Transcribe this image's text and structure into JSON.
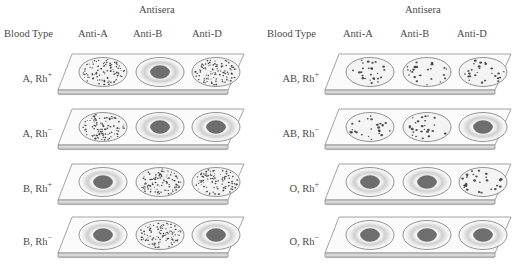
{
  "figure": {
    "title_implied": "ABO and Rh blood typing agglutination slides",
    "column_header_group": "Antisera",
    "column_headers": [
      "Blood Type",
      "Anti-A",
      "Anti-B",
      "Anti-D"
    ],
    "legend": {
      "agglutinated": "speckled / clumped well = positive reaction",
      "smooth": "smooth well with dark center = negative reaction"
    },
    "colors": {
      "text": "#4a4a4a",
      "slide_face": "#fbfbfb",
      "slide_edge": "#8d8d8d",
      "slide_side": "#d8d8d8",
      "well_outline": "#7a7a7a",
      "well_fill": "#f4f4f4",
      "speckle": "#3c3c3c",
      "center_blob": "#6e6e6e",
      "halo": "#cfcfcf"
    }
  },
  "panels": [
    {
      "id": "panel-left",
      "antisera_label": "Antisera",
      "headers": [
        "Blood Type",
        "Anti-A",
        "Anti-B",
        "Anti-D"
      ],
      "rows": [
        {
          "label_main": "A, Rh",
          "label_sup": "+",
          "label_full": "A, Rh+",
          "blood_type": "A",
          "rh": "+",
          "wells": [
            {
              "antiserum": "Anti-A",
              "result": "agglutinated",
              "positive": true,
              "speckle_density": "dense"
            },
            {
              "antiserum": "Anti-B",
              "result": "smooth",
              "positive": false,
              "speckle_density": "none"
            },
            {
              "antiserum": "Anti-D",
              "result": "agglutinated",
              "positive": true,
              "speckle_density": "dense"
            }
          ]
        },
        {
          "label_main": "A, Rh",
          "label_sup": "−",
          "label_full": "A, Rh−",
          "blood_type": "A",
          "rh": "−",
          "wells": [
            {
              "antiserum": "Anti-A",
              "result": "agglutinated",
              "positive": true,
              "speckle_density": "dense"
            },
            {
              "antiserum": "Anti-B",
              "result": "smooth",
              "positive": false,
              "speckle_density": "none"
            },
            {
              "antiserum": "Anti-D",
              "result": "smooth",
              "positive": false,
              "speckle_density": "none"
            }
          ]
        },
        {
          "label_main": "B, Rh",
          "label_sup": "+",
          "label_full": "B, Rh+",
          "blood_type": "B",
          "rh": "+",
          "wells": [
            {
              "antiserum": "Anti-A",
              "result": "smooth",
              "positive": false,
              "speckle_density": "none"
            },
            {
              "antiserum": "Anti-B",
              "result": "agglutinated",
              "positive": true,
              "speckle_density": "dense"
            },
            {
              "antiserum": "Anti-D",
              "result": "agglutinated",
              "positive": true,
              "speckle_density": "dense"
            }
          ]
        },
        {
          "label_main": "B, Rh",
          "label_sup": "−",
          "label_full": "B, Rh−",
          "blood_type": "B",
          "rh": "−",
          "wells": [
            {
              "antiserum": "Anti-A",
              "result": "smooth",
              "positive": false,
              "speckle_density": "none"
            },
            {
              "antiserum": "Anti-B",
              "result": "agglutinated",
              "positive": true,
              "speckle_density": "dense"
            },
            {
              "antiserum": "Anti-D",
              "result": "smooth",
              "positive": false,
              "speckle_density": "none"
            }
          ]
        }
      ]
    },
    {
      "id": "panel-right",
      "antisera_label": "Antisera",
      "headers": [
        "Blood Type",
        "Anti-A",
        "Anti-B",
        "Anti-D"
      ],
      "rows": [
        {
          "label_main": "AB, Rh",
          "label_sup": "+",
          "label_full": "AB, Rh+",
          "blood_type": "AB",
          "rh": "+",
          "wells": [
            {
              "antiserum": "Anti-A",
              "result": "agglutinated",
              "positive": true,
              "speckle_density": "sparse"
            },
            {
              "antiserum": "Anti-B",
              "result": "agglutinated",
              "positive": true,
              "speckle_density": "sparse"
            },
            {
              "antiserum": "Anti-D",
              "result": "agglutinated",
              "positive": true,
              "speckle_density": "sparse"
            }
          ]
        },
        {
          "label_main": "AB, Rh",
          "label_sup": "−",
          "label_full": "AB, Rh−",
          "blood_type": "AB",
          "rh": "−",
          "wells": [
            {
              "antiserum": "Anti-A",
              "result": "agglutinated",
              "positive": true,
              "speckle_density": "sparse"
            },
            {
              "antiserum": "Anti-B",
              "result": "agglutinated",
              "positive": true,
              "speckle_density": "sparse"
            },
            {
              "antiserum": "Anti-D",
              "result": "smooth",
              "positive": false,
              "speckle_density": "none"
            }
          ]
        },
        {
          "label_main": "O, Rh",
          "label_sup": "+",
          "label_full": "O, Rh+",
          "blood_type": "O",
          "rh": "+",
          "wells": [
            {
              "antiserum": "Anti-A",
              "result": "smooth",
              "positive": false,
              "speckle_density": "none"
            },
            {
              "antiserum": "Anti-B",
              "result": "smooth",
              "positive": false,
              "speckle_density": "none"
            },
            {
              "antiserum": "Anti-D",
              "result": "agglutinated",
              "positive": true,
              "speckle_density": "sparse"
            }
          ]
        },
        {
          "label_main": "O, Rh",
          "label_sup": "−",
          "label_full": "O, Rh−",
          "blood_type": "O",
          "rh": "−",
          "wells": [
            {
              "antiserum": "Anti-A",
              "result": "smooth",
              "positive": false,
              "speckle_density": "none"
            },
            {
              "antiserum": "Anti-B",
              "result": "smooth",
              "positive": false,
              "speckle_density": "none"
            },
            {
              "antiserum": "Anti-D",
              "result": "smooth",
              "positive": false,
              "speckle_density": "none"
            }
          ]
        }
      ]
    }
  ]
}
